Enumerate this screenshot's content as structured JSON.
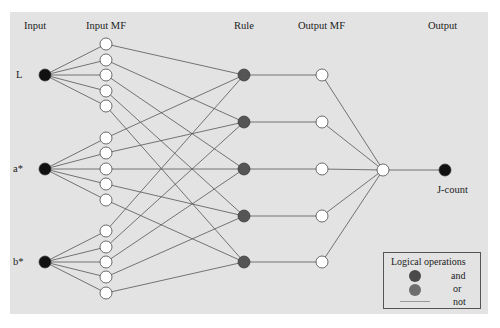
{
  "headers": {
    "input": "Input",
    "input_mf": "Input MF",
    "rule": "Rule",
    "output_mf": "Output MF",
    "output": "Output"
  },
  "inputs": [
    "L",
    "a*",
    "b*"
  ],
  "output_label": "J-count",
  "legend": {
    "title": "Logical operations",
    "items": [
      {
        "label": "and",
        "color": "#4a4a4a"
      },
      {
        "label": "or",
        "color": "#6e6e6e"
      },
      {
        "label": "not",
        "color": "#999999"
      }
    ]
  },
  "colors": {
    "background": "#e3e3e3",
    "input_node": "#111111",
    "rule_node": "#555555",
    "mf_node": "#ffffff",
    "edge": "#555555"
  },
  "network": {
    "input_nodes": [
      {
        "id": "L",
        "x": 45,
        "y": 75
      },
      {
        "id": "a*",
        "x": 45,
        "y": 169
      },
      {
        "id": "b*",
        "x": 45,
        "y": 262
      }
    ],
    "input_mf_nodes": [
      {
        "input": 0,
        "x": 106,
        "y": 44,
        "rule": 0
      },
      {
        "input": 0,
        "x": 106,
        "y": 60,
        "rule": 1
      },
      {
        "input": 0,
        "x": 106,
        "y": 75,
        "rule": 2
      },
      {
        "input": 0,
        "x": 106,
        "y": 91,
        "rule": 3
      },
      {
        "input": 0,
        "x": 106,
        "y": 106,
        "rule": 4
      },
      {
        "input": 1,
        "x": 106,
        "y": 138,
        "rule": 0
      },
      {
        "input": 1,
        "x": 106,
        "y": 153,
        "rule": 1
      },
      {
        "input": 1,
        "x": 106,
        "y": 169,
        "rule": 2
      },
      {
        "input": 1,
        "x": 106,
        "y": 184,
        "rule": 3
      },
      {
        "input": 1,
        "x": 106,
        "y": 200,
        "rule": 4
      },
      {
        "input": 2,
        "x": 106,
        "y": 231,
        "rule": 0
      },
      {
        "input": 2,
        "x": 106,
        "y": 247,
        "rule": 1
      },
      {
        "input": 2,
        "x": 106,
        "y": 262,
        "rule": 2
      },
      {
        "input": 2,
        "x": 106,
        "y": 277,
        "rule": 3
      },
      {
        "input": 2,
        "x": 106,
        "y": 293,
        "rule": 4
      }
    ],
    "rule_nodes": [
      {
        "x": 244,
        "y": 75
      },
      {
        "x": 244,
        "y": 122
      },
      {
        "x": 244,
        "y": 169
      },
      {
        "x": 244,
        "y": 216
      },
      {
        "x": 244,
        "y": 262
      }
    ],
    "output_mf_nodes": [
      {
        "x": 322,
        "y": 75
      },
      {
        "x": 322,
        "y": 122
      },
      {
        "x": 322,
        "y": 169
      },
      {
        "x": 322,
        "y": 216
      },
      {
        "x": 322,
        "y": 262
      }
    ],
    "sum_node": {
      "x": 383,
      "y": 170
    },
    "output_node": {
      "x": 445,
      "y": 170
    }
  }
}
